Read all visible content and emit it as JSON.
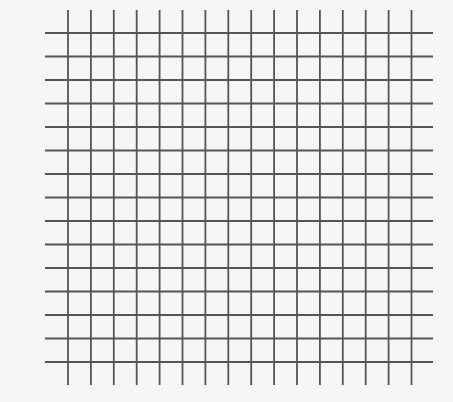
{
  "grid": {
    "description": "Square grid of lines",
    "line_color": "#555555",
    "background_color": "#f6f6f6",
    "line_width": 1.8,
    "vertical_lines": {
      "count": 16,
      "x_start": 68,
      "spacing": 22.9,
      "y_top": 10,
      "y_bottom": 385
    },
    "horizontal_lines": {
      "count": 15,
      "y_start": 33,
      "spacing": 23.5,
      "x_left": 45,
      "x_right": 433
    }
  }
}
